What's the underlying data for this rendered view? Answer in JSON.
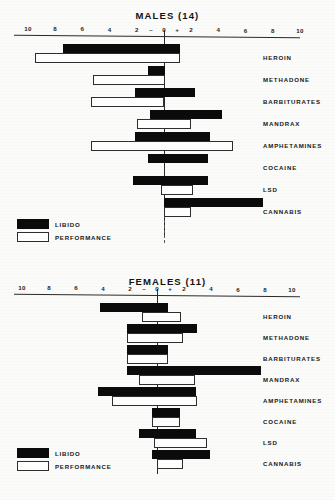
{
  "figure": {
    "background_color": "#fbfbfa",
    "legend_labels": {
      "libido": "LIBIDO",
      "performance": "PERFORMANCE"
    },
    "colors": {
      "libido": "#0b0b0b",
      "performance": "#ffffff",
      "axis": "#2b2b2b",
      "text": "#161616"
    }
  },
  "chart_data": [
    {
      "type": "bar",
      "title": "MALES (14)",
      "orientation": "horizontal",
      "xlabel": "",
      "ylabel": "",
      "xlim": [
        -10,
        10
      ],
      "grid": false,
      "legend_position": "bottom-left",
      "tick_labels": [
        "10",
        "8",
        "6",
        "4",
        "2",
        "0",
        "2",
        "4",
        "6",
        "8",
        "10"
      ],
      "tick_values": [
        -10,
        -8,
        -6,
        -4,
        -2,
        0,
        2,
        4,
        6,
        8,
        10
      ],
      "negative_sign": "–",
      "positive_sign": "+",
      "categories": [
        "HEROIN",
        "METHADONE",
        "BARBITURATES",
        "MANDRAX",
        "AMPHETAMINES",
        "COCAINE",
        "LSD",
        "CANNABIS"
      ],
      "series": [
        {
          "name": "LIBIDO",
          "spans": [
            [
              -7.4,
              1.2
            ],
            [
              -1.2,
              0.1
            ],
            [
              -2.1,
              2.3
            ],
            [
              -1.0,
              4.3
            ],
            [
              -2.1,
              3.4
            ],
            [
              -1.2,
              3.2
            ],
            [
              -2.3,
              3.2
            ],
            [
              0.0,
              7.3
            ]
          ]
        },
        {
          "name": "PERFORMANCE",
          "spans": [
            [
              -9.5,
              1.2
            ],
            [
              -5.2,
              0.1
            ],
            [
              -5.4,
              0.0
            ],
            [
              -2.0,
              2.0
            ],
            [
              -5.4,
              5.1
            ],
            [
              0.0,
              0.0
            ],
            [
              -0.2,
              2.1
            ],
            [
              0.0,
              2.0
            ]
          ]
        }
      ]
    },
    {
      "type": "bar",
      "title": "FEMALES (11)",
      "orientation": "horizontal",
      "xlabel": "",
      "ylabel": "",
      "xlim": [
        -10,
        10
      ],
      "grid": false,
      "legend_position": "bottom-left",
      "tick_labels": [
        "10",
        "8",
        "6",
        "4",
        "2",
        "0",
        "2",
        "4",
        "6",
        "8",
        "10"
      ],
      "tick_values": [
        -10,
        -8,
        -6,
        -4,
        -2,
        0,
        2,
        4,
        6,
        8,
        10
      ],
      "negative_sign": "–",
      "positive_sign": "+",
      "categories": [
        "HEROIN",
        "METHADONE",
        "BARBITURATES",
        "MANDRAX",
        "AMPHETAMINES",
        "COCAINE",
        "LSD",
        "CANNABIS"
      ],
      "series": [
        {
          "name": "LIBIDO",
          "spans": [
            [
              -4.2,
              0.8
            ],
            [
              -2.2,
              3.0
            ],
            [
              -2.2,
              0.8
            ],
            [
              -2.2,
              7.7
            ],
            [
              -4.4,
              2.9
            ],
            [
              -0.4,
              1.7
            ],
            [
              -1.3,
              2.9
            ],
            [
              -0.4,
              3.9
            ]
          ]
        },
        {
          "name": "PERFORMANCE",
          "spans": [
            [
              -1.1,
              1.8
            ],
            [
              -2.2,
              1.9
            ],
            [
              -2.2,
              0.8
            ],
            [
              -1.3,
              2.8
            ],
            [
              -3.3,
              3.0
            ],
            [
              -0.4,
              1.7
            ],
            [
              -0.2,
              3.7
            ],
            [
              0.0,
              1.9
            ]
          ]
        }
      ]
    }
  ]
}
